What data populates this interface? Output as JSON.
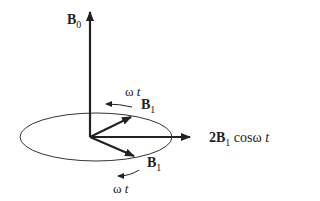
{
  "labels": {
    "b0": {
      "sym": "B",
      "sub": "0"
    },
    "b1_upper": {
      "sym": "B",
      "sub": "1"
    },
    "b1_lower": {
      "sym": "B",
      "sub": "1"
    },
    "omega_upper": {
      "w": "ω",
      "t": " t"
    },
    "omega_lower": {
      "w": "ω",
      "t": " t"
    },
    "sum": {
      "pre": "2",
      "sym": "B",
      "sub": "1",
      "post": " cosω",
      "t": " t"
    }
  },
  "colors": {
    "stroke": "#222222",
    "ellipse": "#333333"
  }
}
